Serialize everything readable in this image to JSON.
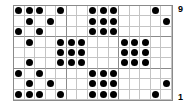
{
  "board": {
    "columns": 15,
    "rows": 9,
    "dot_color": "#000000",
    "cells": [
      [
        1,
        1,
        1,
        0,
        1,
        0,
        0,
        1,
        1,
        1,
        0,
        0,
        0,
        1,
        0
      ],
      [
        0,
        1,
        0,
        1,
        0,
        0,
        0,
        1,
        1,
        1,
        0,
        0,
        0,
        0,
        1
      ],
      [
        1,
        0,
        1,
        0,
        0,
        0,
        0,
        1,
        1,
        1,
        0,
        0,
        0,
        0,
        0
      ],
      [
        0,
        1,
        0,
        0,
        1,
        1,
        1,
        0,
        0,
        0,
        1,
        1,
        1,
        0,
        0
      ],
      [
        0,
        0,
        0,
        0,
        1,
        1,
        1,
        0,
        0,
        0,
        1,
        1,
        1,
        0,
        0
      ],
      [
        0,
        1,
        0,
        0,
        1,
        1,
        1,
        0,
        0,
        0,
        1,
        1,
        1,
        0,
        0
      ],
      [
        1,
        0,
        1,
        0,
        0,
        0,
        0,
        1,
        1,
        1,
        0,
        0,
        0,
        0,
        0
      ],
      [
        0,
        1,
        0,
        1,
        0,
        0,
        0,
        1,
        1,
        1,
        0,
        0,
        0,
        0,
        1
      ],
      [
        1,
        1,
        1,
        0,
        1,
        0,
        0,
        1,
        1,
        1,
        0,
        0,
        0,
        1,
        0
      ]
    ]
  },
  "labels": {
    "top_row": "9",
    "bottom_row": "1"
  }
}
